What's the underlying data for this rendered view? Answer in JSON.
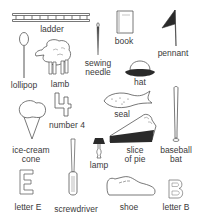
{
  "worksheet": {
    "items": [
      {
        "id": "ladder",
        "label": "ladder"
      },
      {
        "id": "book",
        "label": "book"
      },
      {
        "id": "pennant",
        "label": "pennant"
      },
      {
        "id": "lollipop",
        "label": "lollipop"
      },
      {
        "id": "lamb",
        "label": "lamb"
      },
      {
        "id": "sewing-needle",
        "label_line1": "sewing",
        "label_line2": "needle"
      },
      {
        "id": "hat",
        "label": "hat"
      },
      {
        "id": "number-4",
        "label": "number 4"
      },
      {
        "id": "seal",
        "label": "seal"
      },
      {
        "id": "ice-cream-cone",
        "label_line1": "ice-cream",
        "label_line2": "cone"
      },
      {
        "id": "lamp",
        "label": "lamp"
      },
      {
        "id": "slice-of-pie",
        "label_line1": "slice",
        "label_line2": "of pie"
      },
      {
        "id": "baseball-bat",
        "label_line1": "baseball",
        "label_line2": "bat"
      },
      {
        "id": "letter-e",
        "label": "letter E"
      },
      {
        "id": "screwdriver",
        "label": "screwdriver"
      },
      {
        "id": "shoe",
        "label": "shoe"
      },
      {
        "id": "letter-b",
        "label": "letter B"
      }
    ]
  },
  "colors": {
    "line": "#555555",
    "dark_fill": "#2a2a2a",
    "background": "#ffffff"
  }
}
